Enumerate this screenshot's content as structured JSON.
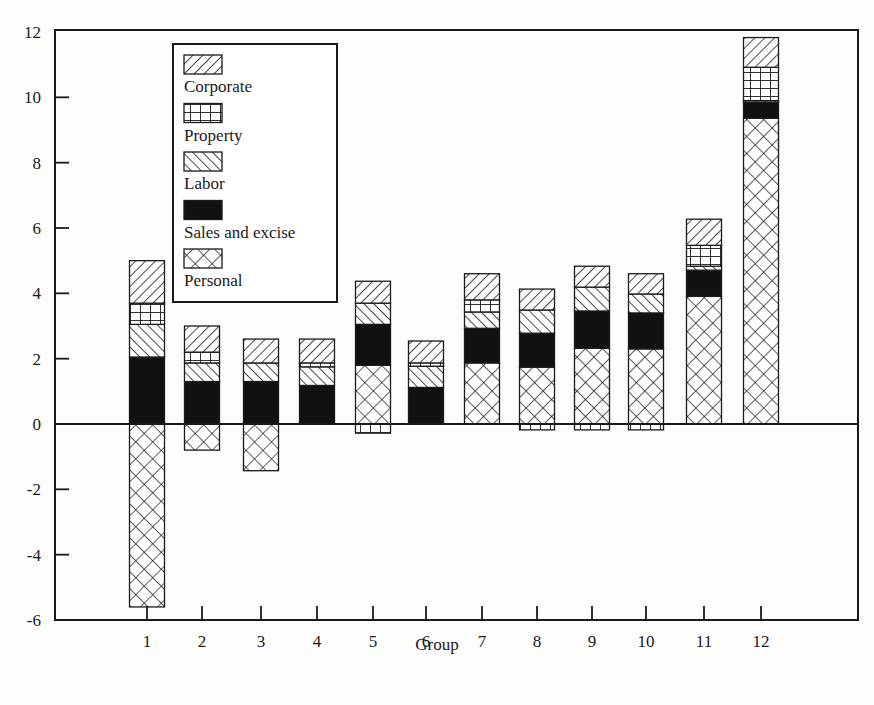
{
  "chart_data": {
    "type": "bar",
    "stacked": true,
    "title": "",
    "xlabel": "Group",
    "ylabel": "",
    "ylim": [
      -6,
      12
    ],
    "yticks": [
      -6,
      -4,
      -2,
      0,
      2,
      4,
      6,
      8,
      10,
      12
    ],
    "categories": [
      "1",
      "2",
      "3",
      "4",
      "5",
      "6",
      "7",
      "8",
      "9",
      "10",
      "11",
      "12"
    ],
    "grid": false,
    "legend_position": "upper-left-inside",
    "series": [
      {
        "name": "Personal",
        "pattern": "crosshatch",
        "values": [
          -5.6,
          -0.8,
          -1.43,
          0,
          1.8,
          0,
          1.87,
          1.74,
          2.32,
          2.3,
          3.91,
          9.36
        ]
      },
      {
        "name": "Sales and excise",
        "pattern": "solid",
        "values": [
          2.05,
          1.3,
          1.3,
          1.18,
          1.25,
          1.12,
          1.06,
          1.04,
          1.14,
          1.1,
          0.8,
          0.49
        ]
      },
      {
        "name": "Labor",
        "pattern": "backslash",
        "values": [
          1.0,
          0.57,
          0.57,
          0.57,
          0.65,
          0.65,
          0.5,
          0.71,
          0.73,
          0.58,
          0.12,
          0.05
        ]
      },
      {
        "name": "Property",
        "pattern": "grid",
        "values": [
          0.65,
          0.33,
          0,
          0.12,
          -0.28,
          0.1,
          0.37,
          -0.18,
          -0.18,
          -0.18,
          0.64,
          1.02
        ]
      },
      {
        "name": "Corporate",
        "pattern": "slash",
        "values": [
          1.3,
          0.8,
          0.73,
          0.73,
          0.67,
          0.67,
          0.8,
          0.64,
          0.64,
          0.62,
          0.8,
          0.91
        ]
      }
    ],
    "stack_order_bottom_to_top": [
      "Personal",
      "Sales and excise",
      "Labor",
      "Property",
      "Corporate"
    ],
    "legend_order": [
      "Corporate",
      "Property",
      "Labor",
      "Sales and excise",
      "Personal"
    ],
    "totals_positive": [
      5.0,
      3.0,
      2.6,
      2.6,
      4.37,
      2.54,
      4.6,
      4.13,
      4.83,
      4.6,
      6.27,
      11.83
    ]
  },
  "colors": {
    "ink": "#1a1a1a",
    "fill": "#ffffff",
    "background": "#fdfdfc"
  }
}
